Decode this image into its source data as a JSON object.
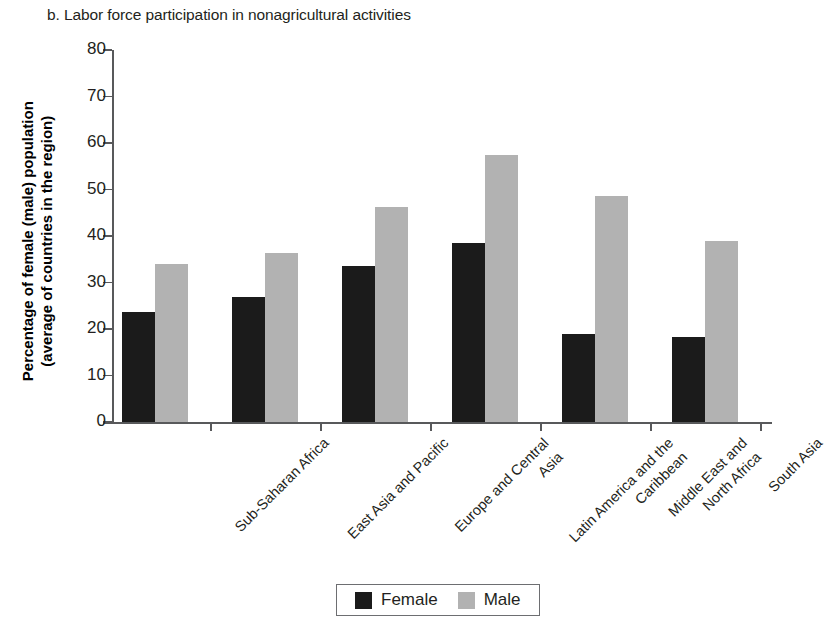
{
  "panel": {
    "caption": "b. Labor force participation in nonagricultural activities"
  },
  "legend": {
    "position": "bottom-center",
    "entries": [
      {
        "label": "Female",
        "color": "#1b1b1b",
        "swatch_name": "legend-swatch-female"
      },
      {
        "label": "Male",
        "color": "#b2b2b2",
        "swatch_name": "legend-swatch-male"
      }
    ]
  },
  "axes": {
    "y_title_line1": "Percentage of female (male) population",
    "y_title_line2": "(average of countries in the region)",
    "y_ticks": [
      "80",
      "70",
      "60",
      "50",
      "40",
      "30",
      "20",
      "10",
      "0"
    ]
  },
  "chart_data": {
    "type": "bar",
    "title": "b. Labor force participation in nonagricultural activities",
    "xlabel": "",
    "ylabel": "Percentage of female (male) population (average of countries in the region)",
    "ylim": [
      0,
      80
    ],
    "ytick_step": 10,
    "grid": false,
    "legend_position": "bottom-center",
    "categories": [
      [
        "Sub-Saharan Africa"
      ],
      [
        "East Asia and Pacific"
      ],
      [
        "Europe and Central",
        "Asia"
      ],
      [
        "Latin America and the",
        "Caribbean"
      ],
      [
        "Middle East and",
        "North Africa"
      ],
      [
        "South Asia"
      ]
    ],
    "category_labels": [
      "Sub-Saharan Africa",
      "East Asia and Pacific",
      "Europe and Central Asia",
      "Latin America and the Caribbean",
      "Middle East and North Africa",
      "South Asia"
    ],
    "series": [
      {
        "name": "Female",
        "color": "#1b1b1b",
        "values": [
          23.7,
          26.8,
          33.5,
          38.4,
          19.0,
          18.3
        ]
      },
      {
        "name": "Male",
        "color": "#b2b2b2",
        "values": [
          34.0,
          36.3,
          46.2,
          57.5,
          48.7,
          38.9
        ]
      }
    ]
  }
}
